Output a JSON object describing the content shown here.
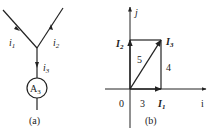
{
  "panel_a": {
    "caption": "(a)",
    "currents": [
      {
        "name": "i",
        "sub": "1"
      },
      {
        "name": "i",
        "sub": "2"
      },
      {
        "name": "i",
        "sub": "3"
      }
    ],
    "meter": {
      "name": "A",
      "sub": "3"
    }
  },
  "panel_b": {
    "caption": "(b)",
    "axes": {
      "x_label": "i",
      "y_label": "j"
    },
    "phasors": [
      {
        "name": "I",
        "sub": "1"
      },
      {
        "name": "I",
        "sub": "2"
      },
      {
        "name": "I",
        "sub": "3"
      }
    ],
    "magnitudes": {
      "I3": "5",
      "I2_side": "4",
      "I1": "3"
    },
    "origin_label": "0"
  },
  "colors": {
    "line": "#222222",
    "background": "#ffffff"
  }
}
